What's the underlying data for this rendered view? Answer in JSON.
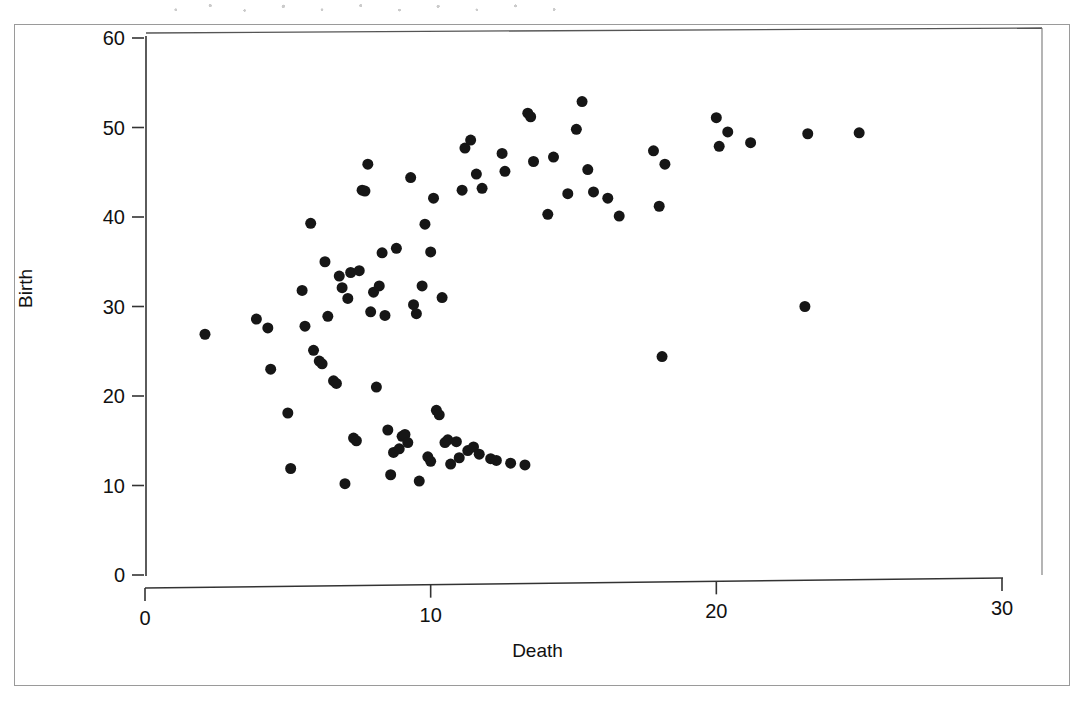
{
  "figure": {
    "frame_visible": true,
    "background_color": "#ffffff"
  },
  "axes": {
    "y_title": "Birth",
    "x_title": "Death",
    "axis_color": "#3a3a3a",
    "point_color": "#161616"
  },
  "chart_data": {
    "type": "scatter",
    "title": "",
    "subtitle": "",
    "xlabel": "Death",
    "ylabel": "Birth",
    "xlim": [
      0,
      30
    ],
    "ylim": [
      0,
      60
    ],
    "xticks": [
      0,
      10,
      20,
      30
    ],
    "yticks": [
      0,
      10,
      20,
      30,
      40,
      50,
      60
    ],
    "xtick_labels": [
      "0",
      "10",
      "20",
      "30"
    ],
    "ytick_labels": [
      "0",
      "10",
      "20",
      "30",
      "40",
      "50",
      "60"
    ],
    "grid": false,
    "legend": null,
    "marker": "filled-circle",
    "marker_color": "#161616",
    "marker_size_px": 11,
    "n_points": 97,
    "points": [
      [
        2.1,
        26.9
      ],
      [
        3.9,
        28.6
      ],
      [
        4.3,
        27.6
      ],
      [
        4.4,
        23.0
      ],
      [
        5.0,
        18.1
      ],
      [
        5.1,
        11.9
      ],
      [
        5.5,
        31.8
      ],
      [
        5.6,
        27.8
      ],
      [
        5.8,
        39.3
      ],
      [
        5.9,
        25.1
      ],
      [
        6.1,
        23.9
      ],
      [
        6.2,
        23.6
      ],
      [
        6.3,
        35.0
      ],
      [
        6.4,
        28.9
      ],
      [
        6.6,
        21.7
      ],
      [
        6.7,
        21.4
      ],
      [
        6.8,
        33.4
      ],
      [
        6.9,
        32.1
      ],
      [
        7.0,
        10.2
      ],
      [
        7.1,
        30.9
      ],
      [
        7.2,
        33.8
      ],
      [
        7.3,
        15.3
      ],
      [
        7.4,
        15.0
      ],
      [
        7.5,
        34.0
      ],
      [
        7.6,
        43.0
      ],
      [
        7.7,
        42.9
      ],
      [
        7.8,
        45.9
      ],
      [
        7.9,
        29.4
      ],
      [
        8.0,
        31.6
      ],
      [
        8.1,
        21.0
      ],
      [
        8.2,
        32.3
      ],
      [
        8.3,
        36.0
      ],
      [
        8.4,
        29.0
      ],
      [
        8.5,
        16.2
      ],
      [
        8.6,
        11.2
      ],
      [
        8.7,
        13.7
      ],
      [
        8.8,
        36.5
      ],
      [
        8.9,
        14.1
      ],
      [
        9.0,
        15.5
      ],
      [
        9.1,
        15.7
      ],
      [
        9.2,
        14.8
      ],
      [
        9.3,
        44.4
      ],
      [
        9.4,
        30.2
      ],
      [
        9.5,
        29.2
      ],
      [
        9.6,
        10.5
      ],
      [
        9.7,
        32.3
      ],
      [
        9.8,
        39.2
      ],
      [
        9.9,
        13.2
      ],
      [
        10.0,
        12.7
      ],
      [
        10.0,
        36.1
      ],
      [
        10.1,
        42.1
      ],
      [
        10.2,
        18.4
      ],
      [
        10.3,
        17.9
      ],
      [
        10.4,
        31.0
      ],
      [
        10.5,
        14.8
      ],
      [
        10.6,
        15.1
      ],
      [
        10.7,
        12.4
      ],
      [
        10.9,
        14.9
      ],
      [
        11.0,
        13.1
      ],
      [
        11.1,
        43.0
      ],
      [
        11.2,
        47.7
      ],
      [
        11.3,
        13.9
      ],
      [
        11.4,
        48.6
      ],
      [
        11.5,
        14.3
      ],
      [
        11.6,
        44.8
      ],
      [
        11.7,
        13.5
      ],
      [
        11.8,
        43.2
      ],
      [
        12.1,
        13.0
      ],
      [
        12.3,
        12.8
      ],
      [
        12.5,
        47.1
      ],
      [
        12.6,
        45.1
      ],
      [
        12.8,
        12.5
      ],
      [
        13.3,
        12.3
      ],
      [
        13.4,
        51.6
      ],
      [
        13.5,
        51.2
      ],
      [
        13.6,
        46.2
      ],
      [
        14.1,
        40.3
      ],
      [
        14.3,
        46.7
      ],
      [
        14.8,
        42.6
      ],
      [
        15.1,
        49.8
      ],
      [
        15.3,
        52.9
      ],
      [
        15.5,
        45.3
      ],
      [
        15.7,
        42.8
      ],
      [
        16.2,
        42.1
      ],
      [
        16.6,
        40.1
      ],
      [
        17.8,
        47.4
      ],
      [
        18.0,
        41.2
      ],
      [
        18.1,
        24.4
      ],
      [
        18.2,
        45.9
      ],
      [
        20.0,
        51.1
      ],
      [
        20.1,
        47.9
      ],
      [
        20.4,
        49.5
      ],
      [
        21.2,
        48.3
      ],
      [
        23.1,
        30.0
      ],
      [
        23.2,
        49.3
      ],
      [
        25.0,
        49.4
      ]
    ]
  },
  "geometry": {
    "plot_left_px": 145,
    "plot_right_px": 1002,
    "plot_top_px": 38,
    "plot_bottom_px": 575,
    "panel_top_px": 32,
    "panel_right_px": 1042
  }
}
